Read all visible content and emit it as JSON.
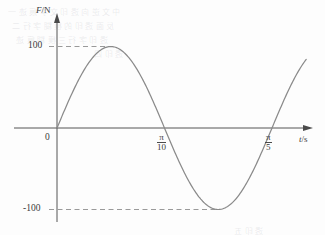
{
  "figure": {
    "axis_labels": {
      "y": {
        "quantity": "F",
        "sep": "/",
        "unit": "N"
      },
      "x": {
        "quantity": "t",
        "sep": "/",
        "unit": "s"
      }
    },
    "origin_label": "0",
    "y_ticks": [
      {
        "value": 100,
        "label": "100",
        "dashed_guide": true
      },
      {
        "value": -100,
        "label": "-100",
        "dashed_guide": true
      }
    ],
    "x_ticks": [
      {
        "label_numerator": "π",
        "label_denominator": "10",
        "value_text": "π/10"
      },
      {
        "label_numerator": "π",
        "label_denominator": "5",
        "value_text": "π/5"
      }
    ],
    "colors": {
      "curve": "#8a8a8a",
      "axis": "#555555",
      "guide": "#9a9a9a",
      "text": "#3b3b3b",
      "background": "#fdfdfd"
    },
    "scan_artifacts": [
      "中文逆向透印文字痕迹一",
      "反面透印的模糊字行二",
      "透印字行三模糊痕迹",
      "透印四",
      "透印五"
    ]
  },
  "chart_data": {
    "type": "line",
    "title": "",
    "xlabel": "t/s",
    "ylabel": "F/N",
    "xlim": [
      0,
      0.7283
    ],
    "ylim": [
      -140,
      140
    ],
    "grid": false,
    "legend": null,
    "annotations": [
      {
        "text": "100",
        "type": "y-tick-with-dashed-guide",
        "y": 100
      },
      {
        "text": "-100",
        "type": "y-tick-with-dashed-guide",
        "y": -100
      },
      {
        "text": "π/10",
        "type": "x-tick",
        "x": 0.3142
      },
      {
        "text": "π/5",
        "type": "x-tick",
        "x": 0.6283
      },
      {
        "text": "0",
        "type": "origin"
      }
    ],
    "series": [
      {
        "name": "F(t)",
        "equation": "F = 100 sin(10 t)",
        "amplitude": 100,
        "period": 0.6283,
        "x": [
          0.0,
          0.0393,
          0.0785,
          0.1178,
          0.1571,
          0.1963,
          0.2356,
          0.2749,
          0.3142,
          0.3534,
          0.3927,
          0.432,
          0.4712,
          0.5105,
          0.5498,
          0.589,
          0.6283,
          0.6676,
          0.7068,
          0.7283
        ],
        "values": [
          0,
          38.3,
          70.7,
          92.4,
          100,
          92.4,
          70.7,
          38.3,
          0,
          -38.3,
          -70.7,
          -92.4,
          -100,
          -92.4,
          -70.7,
          -38.3,
          0,
          38.3,
          70.7,
          81.9
        ]
      }
    ]
  }
}
